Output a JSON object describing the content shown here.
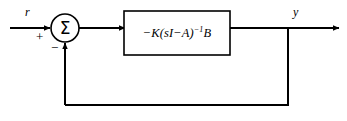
{
  "diagram": {
    "type": "control-system-block-diagram",
    "background_color": "#ffffff",
    "line_color": "#000000",
    "signals": {
      "input_label": "r",
      "output_label": "y"
    },
    "summing_junction": {
      "symbol": "Σ",
      "name": "summing-junction",
      "positive_sign": "+",
      "negative_sign": "−",
      "center_x": 65,
      "center_y": 28,
      "radius": 14
    },
    "blocks": [
      {
        "name": "plant-transfer-function-block",
        "expression_plain": "−K(sI−A)⁻¹B",
        "expression_parts": {
          "lead": "−K(",
          "s": "s",
          "i": "I",
          "minus": "−",
          "a": "A",
          "close": ")",
          "exponent": "−1",
          "b": "B"
        },
        "x": 124,
        "y": 11,
        "width": 106,
        "height": 44
      }
    ],
    "connections": [
      {
        "name": "input-line",
        "from": "r",
        "to": "summing-junction",
        "arrow": true
      },
      {
        "name": "summer-to-block-line",
        "from": "summing-junction",
        "to": "plant-block",
        "arrow": true
      },
      {
        "name": "block-to-output-line",
        "from": "plant-block",
        "to": "y",
        "arrow": true
      },
      {
        "name": "feedback-line",
        "from": "output-tap",
        "to": "summing-junction",
        "arrow": true,
        "sign": "−"
      }
    ]
  }
}
